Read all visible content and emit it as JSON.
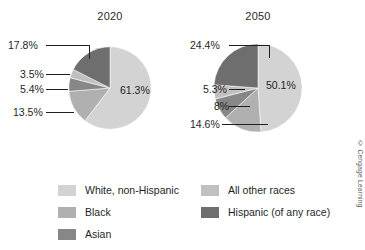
{
  "credit": "© Cengage Learning",
  "colors": {
    "white_non_hispanic": "#d3d3d3",
    "black": "#b0b0b0",
    "asian": "#878787",
    "all_other_races": "#c0c0c0",
    "hispanic": "#6e6e6e",
    "background": "#ffffff",
    "text": "#1f1f1f",
    "leader_line": "#1f1f1f"
  },
  "legend": {
    "left": [
      {
        "label": "White, non-Hispanic",
        "color": "#d3d3d3",
        "swatch_name": "swatch-white-non-hispanic"
      },
      {
        "label": "Black",
        "color": "#b0b0b0",
        "swatch_name": "swatch-black"
      },
      {
        "label": "Asian",
        "color": "#878787",
        "swatch_name": "swatch-asian"
      }
    ],
    "right": [
      {
        "label": "All other races",
        "color": "#c0c0c0",
        "swatch_name": "swatch-all-other-races"
      },
      {
        "label": "Hispanic (of any race)",
        "color": "#6e6e6e",
        "swatch_name": "swatch-hispanic"
      }
    ]
  },
  "chart_data": [
    {
      "type": "pie",
      "title": "2020",
      "categories": [
        "White, non-Hispanic",
        "Hispanic (of any race)",
        "All other races",
        "Asian",
        "Black"
      ],
      "values": [
        61.3,
        17.8,
        3.5,
        5.4,
        13.5
      ],
      "labels": [
        "61.3%",
        "17.8%",
        "3.5%",
        "5.4%",
        "13.5%"
      ],
      "colors": [
        "#d3d3d3",
        "#6e6e6e",
        "#c0c0c0",
        "#878787",
        "#b0b0b0"
      ],
      "inner_label": "61.3%",
      "callouts": [
        "17.8%",
        "3.5%",
        "5.4%",
        "13.5%"
      ],
      "start_angle_deg": 0,
      "direction": "clockwise",
      "legend_position": "bottom"
    },
    {
      "type": "pie",
      "title": "2050",
      "categories": [
        "White, non-Hispanic",
        "Hispanic (of any race)",
        "All other races",
        "Asian",
        "Black"
      ],
      "values": [
        50.1,
        24.4,
        5.3,
        8.0,
        14.6
      ],
      "labels": [
        "50.1%",
        "24.4%",
        "5.3%",
        "8%",
        "14.6%"
      ],
      "colors": [
        "#d3d3d3",
        "#6e6e6e",
        "#c0c0c0",
        "#878787",
        "#b0b0b0"
      ],
      "inner_label": "50.1%",
      "callouts": [
        "24.4%",
        "5.3%",
        "8%",
        "14.6%"
      ],
      "start_angle_deg": 0,
      "direction": "clockwise",
      "legend_position": "bottom"
    }
  ]
}
